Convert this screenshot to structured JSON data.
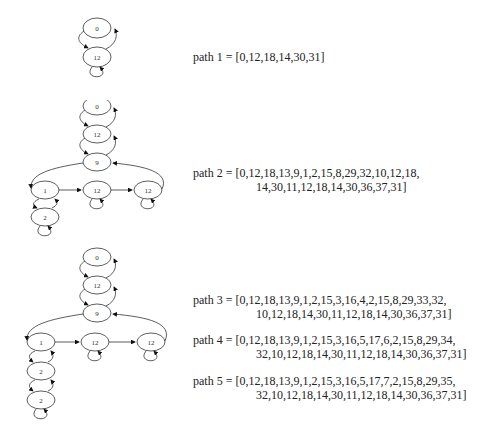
{
  "graphs": [
    {
      "id": "graph-1",
      "nodes": [
        {
          "id": "n0",
          "label": "0"
        },
        {
          "id": "n12",
          "label": "12"
        }
      ]
    },
    {
      "id": "graph-2",
      "nodes": [
        {
          "id": "n0",
          "label": "0"
        },
        {
          "id": "n12a",
          "label": "12"
        },
        {
          "id": "n9",
          "label": "9"
        },
        {
          "id": "n1",
          "label": "1"
        },
        {
          "id": "n12b",
          "label": "12"
        },
        {
          "id": "n12c",
          "label": "12"
        },
        {
          "id": "n2",
          "label": "2"
        }
      ]
    },
    {
      "id": "graph-3",
      "nodes": [
        {
          "id": "n0",
          "label": "0"
        },
        {
          "id": "n12a",
          "label": "12"
        },
        {
          "id": "n9",
          "label": "9"
        },
        {
          "id": "n1",
          "label": "1"
        },
        {
          "id": "n12b",
          "label": "12"
        },
        {
          "id": "n12c",
          "label": "12"
        },
        {
          "id": "n2a",
          "label": "2"
        },
        {
          "id": "n2b",
          "label": "2"
        }
      ]
    }
  ],
  "paths": [
    {
      "label": "path 1 = ",
      "line1": "[0,12,18,14,30,31]",
      "line2": ""
    },
    {
      "label": "path 2 = ",
      "line1": "[0,12,18,13,9,1,2,15,8,29,32,10,12,18,",
      "line2": "14,30,11,12,18,14,30,36,37,31]"
    },
    {
      "label": "path 3 = ",
      "line1": "[0,12,18,13,9,1,2,15,3,16,4,2,15,8,29,33,32,",
      "line2": "10,12,18,14,30,11,12,18,14,30,36,37,31]"
    },
    {
      "label": "path 4 = ",
      "line1": "[0,12,18,13,9,1,2,15,3,16,5,17,6,2,15,8,29,34,",
      "line2": "32,10,12,18,14,30,11,12,18,14,30,36,37,31]"
    },
    {
      "label": "path 5 = ",
      "line1": "[0,12,18,13,9,1,2,15,3,16,5,17,7,2,15,8,29,35,",
      "line2": "32,10,12,18,14,30,11,12,18,14,30,36,37,31]"
    }
  ]
}
